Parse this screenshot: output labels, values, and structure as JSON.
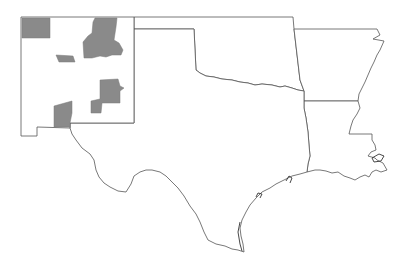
{
  "map": {
    "region": "South Central United States",
    "states": [
      {
        "name": "New Mexico",
        "id": "nm"
      },
      {
        "name": "Texas",
        "id": "tx"
      },
      {
        "name": "Oklahoma",
        "id": "ok"
      },
      {
        "name": "Arkansas",
        "id": "ar"
      },
      {
        "name": "Louisiana",
        "id": "la"
      }
    ],
    "highlighted_regions": [
      {
        "state": "New Mexico",
        "location": "northwest corner"
      },
      {
        "state": "New Mexico",
        "location": "north central"
      },
      {
        "state": "New Mexico",
        "location": "west central"
      },
      {
        "state": "New Mexico",
        "location": "east central"
      },
      {
        "state": "New Mexico",
        "location": "south central"
      }
    ],
    "colors": {
      "background": "#ffffff",
      "state_fill": "#ffffff",
      "border": "#555555",
      "highlight": "#8a8a8a"
    }
  }
}
